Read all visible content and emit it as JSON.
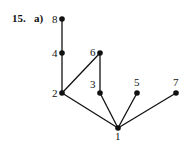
{
  "header": {
    "problem_number": "15.",
    "part": "a)"
  },
  "diagram": {
    "type": "hasse",
    "nodes": [
      {
        "id": "8",
        "label": "8",
        "x": 62,
        "y": 19,
        "lx": 52,
        "ly": 23
      },
      {
        "id": "4",
        "label": "4",
        "x": 62,
        "y": 53,
        "lx": 52,
        "ly": 57
      },
      {
        "id": "6",
        "label": "6",
        "x": 100,
        "y": 53,
        "lx": 90,
        "ly": 56
      },
      {
        "id": "2",
        "label": "2",
        "x": 62,
        "y": 93,
        "lx": 52,
        "ly": 97
      },
      {
        "id": "3",
        "label": "3",
        "x": 100,
        "y": 93,
        "lx": 90,
        "ly": 88
      },
      {
        "id": "5",
        "label": "5",
        "x": 137,
        "y": 93,
        "lx": 134,
        "ly": 86
      },
      {
        "id": "7",
        "label": "7",
        "x": 176,
        "y": 93,
        "lx": 173,
        "ly": 86
      },
      {
        "id": "1",
        "label": "1",
        "x": 118,
        "y": 128,
        "lx": 115,
        "ly": 140
      }
    ],
    "edges": [
      [
        "8",
        "4"
      ],
      [
        "4",
        "2"
      ],
      [
        "2",
        "6"
      ],
      [
        "6",
        "3"
      ],
      [
        "2",
        "1"
      ],
      [
        "3",
        "1"
      ],
      [
        "5",
        "1"
      ],
      [
        "7",
        "1"
      ]
    ],
    "colors": {
      "line": "#111111",
      "node": "#111111"
    }
  }
}
